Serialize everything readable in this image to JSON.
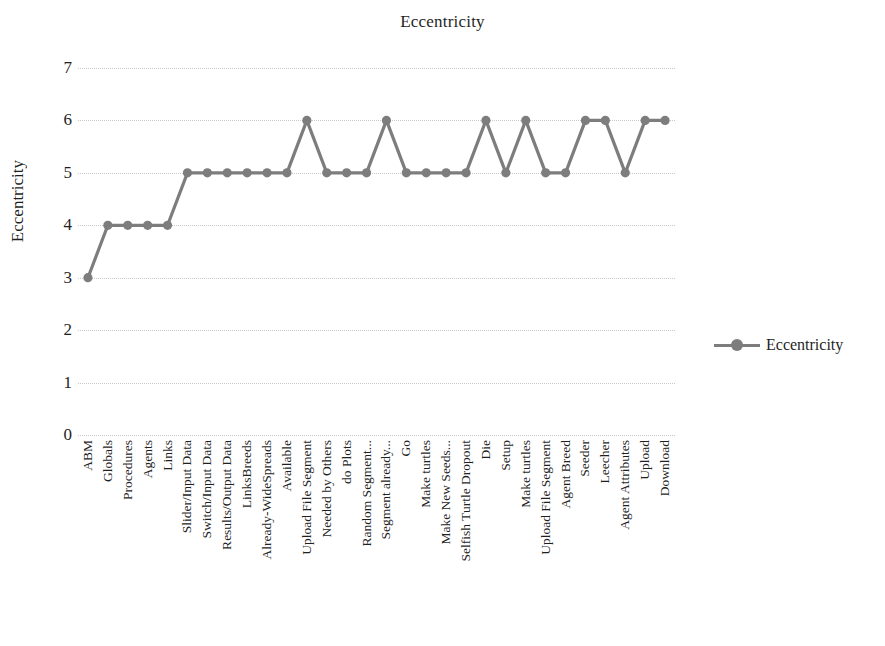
{
  "chart_data": {
    "type": "line",
    "title": "Eccentricity",
    "xlabel": "",
    "ylabel": "Eccentricity",
    "ylim": [
      0,
      7
    ],
    "ytick_labels": [
      "7",
      "6",
      "5",
      "4",
      "3",
      "2",
      "1",
      "0"
    ],
    "grid": true,
    "legend_position": "right",
    "legend_entries": [
      "Eccentricity"
    ],
    "series_color": "#7d7d7d",
    "categories": [
      "ABM",
      "Globals",
      "Procedures",
      "Agents",
      "Links",
      "Slider/Input Data",
      "Switch/Input Data",
      "Results/Output Data",
      "LinksBreeds",
      "Already-WideSpreads",
      "Available",
      "Upload File Segment",
      "Needed by Others",
      "do Plots",
      "Random Segment...",
      "Segment already...",
      "Go",
      "Make turtles",
      "Make New Seeds...",
      "Selfish Turtle Dropout",
      "Die",
      "Setup",
      "Make turtles",
      "Upload File Segment",
      "Agent Breed",
      "Seeder",
      "Leecher",
      "Agent Attributes",
      "Upload",
      "Download"
    ],
    "series": [
      {
        "name": "Eccentricity",
        "values": [
          3,
          4,
          4,
          4,
          4,
          5,
          5,
          5,
          5,
          5,
          5,
          6,
          5,
          5,
          5,
          6,
          5,
          5,
          5,
          5,
          6,
          5,
          6,
          5,
          5,
          6,
          6,
          5,
          6,
          6
        ]
      }
    ]
  }
}
